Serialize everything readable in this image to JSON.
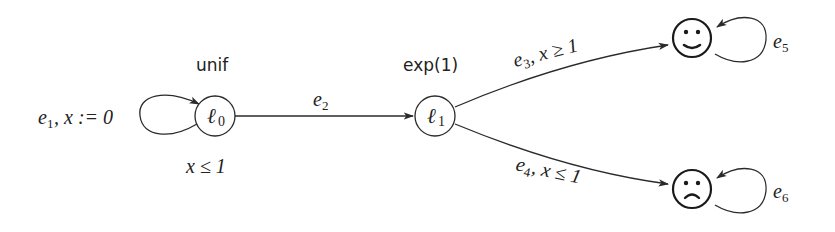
{
  "diagram": {
    "type": "stochastic timed automaton",
    "nodes": [
      {
        "id": "l0",
        "label": "ℓ",
        "sub": "0",
        "distribution": "unif",
        "invariant": "x ≤ 1"
      },
      {
        "id": "l1",
        "label": "ℓ",
        "sub": "1",
        "distribution": "exp(1)"
      },
      {
        "id": "happy",
        "label": "☺",
        "kind": "smiley-accepting"
      },
      {
        "id": "sad",
        "label": "☹",
        "kind": "frowny-rejecting"
      }
    ],
    "edges": [
      {
        "id": "e1",
        "from": "l0",
        "to": "l0",
        "name": "e",
        "sub": "1",
        "label_rest": ", x := 0"
      },
      {
        "id": "e2",
        "from": "l0",
        "to": "l1",
        "name": "e",
        "sub": "2",
        "label_rest": ""
      },
      {
        "id": "e3",
        "from": "l1",
        "to": "happy",
        "name": "e",
        "sub": "3",
        "label_rest": ",  x ≥ 1"
      },
      {
        "id": "e4",
        "from": "l1",
        "to": "sad",
        "name": "e",
        "sub": "4",
        "label_rest": ",  x ≤ 1"
      },
      {
        "id": "e5",
        "from": "happy",
        "to": "happy",
        "name": "e",
        "sub": "5",
        "label_rest": ""
      },
      {
        "id": "e6",
        "from": "sad",
        "to": "sad",
        "name": "e",
        "sub": "6",
        "label_rest": ""
      }
    ]
  },
  "labels": {
    "l0_name": "ℓ",
    "l0_sub": "0",
    "l0_dist": "unif",
    "l0_invariant": "x ≤ 1",
    "l1_name": "ℓ",
    "l1_sub": "1",
    "l1_dist": "exp(1)",
    "e1_name": "e",
    "e1_sub": "1",
    "e1_rest": ", x := 0",
    "e2_name": "e",
    "e2_sub": "2",
    "e3_name": "e",
    "e3_sub": "3",
    "e3_rest": ",  x ≥ 1",
    "e4_name": "e",
    "e4_sub": "4",
    "e4_rest": ",  x ≤ 1",
    "e5_name": "e",
    "e5_sub": "5",
    "e6_name": "e",
    "e6_sub": "6"
  },
  "colors": {
    "ink": "#2a2a2a",
    "background": "#ffffff"
  }
}
